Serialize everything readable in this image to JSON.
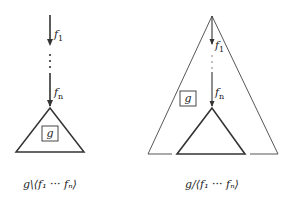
{
  "left_diagram": {
    "edge_labels": [
      "f",
      "f"
    ],
    "edge_subscripts": [
      "1",
      "n"
    ],
    "box_label": "g",
    "caption": "g\\⟨f₁ ··· fₙ⟩"
  },
  "right_diagram": {
    "edge_labels": [
      "f",
      "f"
    ],
    "edge_subscripts": [
      "1",
      "n"
    ],
    "box_label": "g",
    "caption": "g/⟨f₁ ··· fₙ⟩"
  },
  "colors": {
    "stroke": "#333333",
    "background": "#ffffff"
  }
}
